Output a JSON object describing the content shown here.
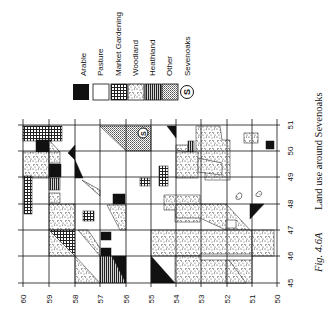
{
  "figure": {
    "caption_label": "Fig. 4.6A",
    "caption_text": "Land use around Sevenoaks"
  },
  "legend": {
    "items": [
      {
        "key": "arable",
        "label": "Arable",
        "pattern": "solid-black"
      },
      {
        "key": "pasture",
        "label": "Pasture",
        "pattern": "white"
      },
      {
        "key": "market_gardening",
        "label": "Market Gardening",
        "pattern": "cross-hatch"
      },
      {
        "key": "woodland",
        "label": "Woodland",
        "pattern": "speckle"
      },
      {
        "key": "heathland",
        "label": "Heathland",
        "pattern": "vertical-stripes"
      },
      {
        "key": "other",
        "label": "Other",
        "pattern": "fine-dots"
      },
      {
        "key": "sevenoaks",
        "label": "Sevenoaks",
        "pattern": "circled-S"
      }
    ]
  },
  "map": {
    "grid_x_labels": [
      "60",
      "59",
      "58",
      "57",
      "56",
      "55",
      "54",
      "53",
      "52",
      "51",
      "50"
    ],
    "grid_y_labels": [
      "51",
      "50",
      "49",
      "48",
      "47",
      "46",
      "45"
    ],
    "town_marker": "S",
    "colors": {
      "ink": "#111111",
      "paper": "#ffffff"
    }
  }
}
